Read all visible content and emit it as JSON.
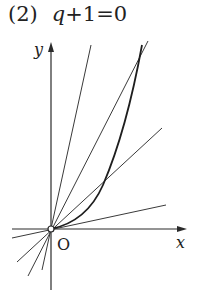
{
  "problem": {
    "number": "(2)",
    "condition_var": "q",
    "condition_rest": "+1=0"
  },
  "diagram": {
    "x_axis_label": "x",
    "y_axis_label": "y",
    "origin_label": "O",
    "colors": {
      "stroke": "#2a2a2a",
      "background": "#ffffff"
    },
    "origin_px": [
      51,
      229
    ],
    "curve_description": "cubic-like curve through origin, tangent to x-axis at O, rising steeply",
    "lines_through_origin": [
      {
        "name": "steep-line",
        "end_px": [
          91,
          45
        ]
      },
      {
        "name": "chord-line-upper",
        "end_px": [
          148,
          41
        ]
      },
      {
        "name": "chord-line-mid",
        "end_px": [
          162,
          128
        ]
      },
      {
        "name": "shallow-line",
        "end_px": [
          166,
          205
        ]
      }
    ]
  }
}
